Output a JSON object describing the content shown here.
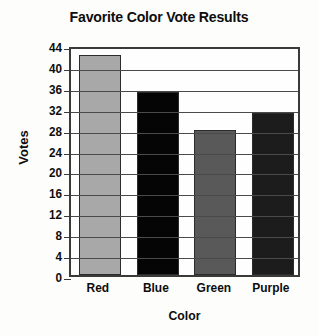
{
  "chart_data": {
    "type": "bar",
    "title": "Favorite Color Vote Results",
    "xlabel": "Color",
    "ylabel": "Votes",
    "categories": [
      "Red",
      "Blue",
      "Green",
      "Purple"
    ],
    "values": [
      42,
      35,
      27.8,
      31
    ],
    "ylim": [
      0,
      44
    ],
    "ytick_step": 4,
    "yticks": [
      44,
      40,
      36,
      32,
      28,
      24,
      20,
      16,
      12,
      8,
      4,
      0
    ],
    "grid": true,
    "legend": "none",
    "bar_colors": [
      "#a8a8a8",
      "#050505",
      "#595959",
      "#1c1c1c"
    ],
    "bar_edge_color": "#2b2b2b",
    "axis_color": "#3a3a3a",
    "grid_color": "#4a4a4a",
    "text_color": "#0d0d0d",
    "background": "#fdfdfb"
  }
}
